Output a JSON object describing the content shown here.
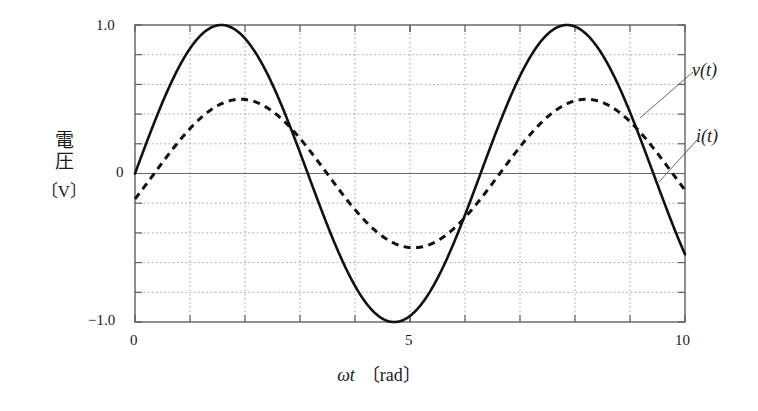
{
  "chart_data": {
    "type": "line",
    "title": "",
    "subtitle": "",
    "xlabel": "ωt 〔rad〕",
    "xlabel_symbol": "ωt",
    "xlabel_unit": "〔rad〕",
    "ylabel": "電圧 〔V〕",
    "ylabel_name": "電圧",
    "ylabel_unit": "〔V〕",
    "xlim": [
      0,
      10
    ],
    "ylim": [
      -1.0,
      1.0
    ],
    "xticks": [
      0,
      5,
      10
    ],
    "xtick_labels": [
      "0",
      "5",
      "10"
    ],
    "yticks": [
      -1.0,
      0,
      1.0
    ],
    "ytick_labels": [
      "-1.0",
      "0",
      "1.0"
    ],
    "x_gridlines": [
      1,
      2,
      3,
      4,
      5,
      6,
      7,
      8,
      9
    ],
    "y_gridlines": [
      -0.8,
      -0.6,
      -0.4,
      -0.2,
      0.2,
      0.4,
      0.6,
      0.8
    ],
    "grid": true,
    "grid_style": "dotted",
    "legend_position": "right-annotations",
    "series": [
      {
        "name": "v(t)",
        "label": "v(t)",
        "style": "solid",
        "color": "#111111",
        "amplitude": 1.0,
        "period": 6.2832,
        "phase_rad": 0.0,
        "equation": "v(t) = 1.0 sin(t)",
        "x": [
          0,
          0.25,
          0.5,
          0.75,
          1,
          1.25,
          1.5,
          1.5708,
          1.75,
          2,
          2.25,
          2.5,
          2.75,
          3,
          3.1416,
          3.25,
          3.5,
          3.75,
          4,
          4.25,
          4.5,
          4.7124,
          4.75,
          5,
          5.25,
          5.5,
          5.75,
          6,
          6.2832,
          6.5,
          6.75,
          7,
          7.25,
          7.5,
          7.75,
          7.854,
          8,
          8.25,
          8.5,
          8.75,
          9,
          9.25,
          9.4248,
          9.5,
          9.75,
          10
        ],
        "values": [
          0.0,
          0.247,
          0.479,
          0.682,
          0.841,
          0.949,
          0.997,
          1.0,
          0.984,
          0.909,
          0.778,
          0.599,
          0.382,
          0.141,
          0.0,
          -0.108,
          -0.351,
          -0.572,
          -0.757,
          -0.895,
          -0.978,
          -1.0,
          -0.999,
          -0.959,
          -0.861,
          -0.706,
          -0.501,
          -0.279,
          0.0,
          0.215,
          0.453,
          0.657,
          0.814,
          0.938,
          0.994,
          1.0,
          0.989,
          0.919,
          0.798,
          0.625,
          0.412,
          0.174,
          0.0,
          -0.075,
          -0.321,
          -0.544
        ]
      },
      {
        "name": "i(t)",
        "label": "i(t)",
        "style": "dashed",
        "color": "#111111",
        "amplitude": 0.5,
        "period": 6.2832,
        "phase_rad": -0.35,
        "equation": "i(t) = 0.5 sin(t - 0.35)",
        "x": [
          0,
          0.25,
          0.5,
          0.75,
          1,
          1.25,
          1.5,
          1.75,
          1.92,
          2,
          2.25,
          2.5,
          2.75,
          3,
          3.25,
          3.4916,
          3.5,
          3.75,
          4,
          4.25,
          4.5,
          4.75,
          5,
          5.0624,
          5.25,
          5.5,
          5.75,
          6,
          6.25,
          6.5,
          6.6332,
          6.75,
          7,
          7.25,
          7.5,
          7.75,
          8,
          8.2,
          8.25,
          8.5,
          8.75,
          9,
          9.25,
          9.5,
          9.7748,
          10
        ],
        "values": [
          -0.172,
          0.05,
          0.0715,
          0.2,
          0.324,
          0.42,
          0.478,
          0.5,
          0.5,
          0.498,
          0.474,
          0.414,
          0.323,
          0.208,
          0.077,
          0.0,
          -0.06,
          -0.192,
          -0.312,
          -0.404,
          -0.469,
          -0.497,
          -0.5,
          -0.5,
          -0.483,
          -0.43,
          -0.345,
          -0.235,
          -0.108,
          0.027,
          0.0,
          0.122,
          0.253,
          0.36,
          0.44,
          0.489,
          0.5,
          0.5,
          0.491,
          0.45,
          0.376,
          0.273,
          0.151,
          0.018,
          0.0,
          -0.248
        ]
      }
    ],
    "annotations": [
      {
        "text": "v(t)",
        "target_series": "v(t)",
        "position": "upper-right"
      },
      {
        "text": "i(t)",
        "target_series": "i(t)",
        "position": "right"
      }
    ]
  },
  "axes": {
    "x_tick_0": "0",
    "x_tick_5": "5",
    "x_tick_10": "10",
    "y_tick_top": "1.0",
    "y_tick_mid": "0",
    "y_tick_bottom": "−1.0"
  },
  "labels": {
    "y_axis_kanji_1": "電",
    "y_axis_kanji_2": "圧",
    "y_axis_unit": "〔V〕",
    "x_axis_symbol": "ωt",
    "x_axis_unit": "〔rad〕",
    "series_v": "v(t)",
    "series_i": "i(t)"
  },
  "colors": {
    "curve": "#111111",
    "grid": "#999999",
    "axis": "#555555",
    "frame": "#555555",
    "background": "#ffffff",
    "text": "#1a1a1a"
  }
}
